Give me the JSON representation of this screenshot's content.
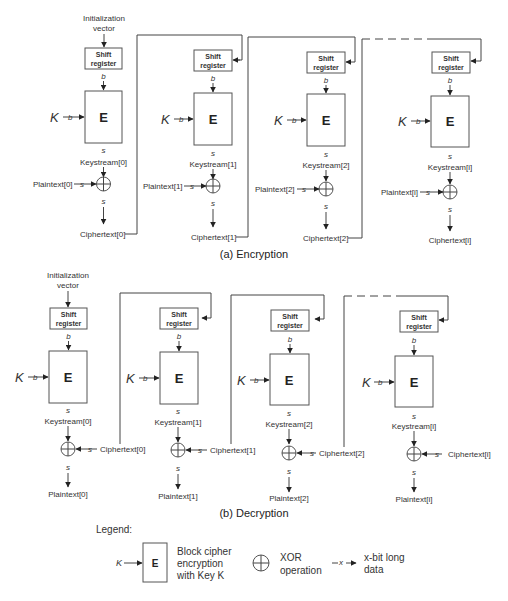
{
  "encryption": {
    "caption": "(a) Encryption",
    "iv_line1": "Initialization",
    "iv_line2": "vector",
    "stages": [
      {
        "shift1": "Shift",
        "shift2": "register",
        "b": "b",
        "E": "E",
        "K": "K",
        "kb": "b",
        "s1": "s",
        "keystream": "Keystream[0]",
        "plaintext": "Plaintext[0]",
        "ps": "s",
        "s2": "s",
        "ciphertext": "Ciphertext[0]"
      },
      {
        "shift1": "Shift",
        "shift2": "register",
        "b": "b",
        "E": "E",
        "K": "K",
        "kb": "b",
        "s1": "s",
        "keystream": "Keystream[1]",
        "plaintext": "Plaintext[1]",
        "ps": "s",
        "s2": "s",
        "ciphertext": "Ciphertext[1]"
      },
      {
        "shift1": "Shift",
        "shift2": "register",
        "b": "b",
        "E": "E",
        "K": "K",
        "kb": "b",
        "s1": "s",
        "keystream": "Keystream[2]",
        "plaintext": "Plaintext[2]",
        "ps": "s",
        "s2": "s",
        "ciphertext": "Ciphertext[2]"
      },
      {
        "shift1": "Shift",
        "shift2": "register",
        "b": "b",
        "E": "E",
        "K": "K",
        "kb": "b",
        "s1": "s",
        "keystream": "Keystream[i]",
        "plaintext": "Plaintext[i]",
        "ps": "s",
        "s2": "s",
        "ciphertext": "Ciphertext[i]"
      }
    ]
  },
  "decryption": {
    "caption": "(b) Decryption",
    "iv_line1": "Initialization",
    "iv_line2": "vector",
    "stages": [
      {
        "shift1": "Shift",
        "shift2": "register",
        "b": "b",
        "E": "E",
        "K": "K",
        "kb": "b",
        "s1": "s",
        "keystream": "Keystream[0]",
        "ciphertext": "Ciphertext[0]",
        "cs": "s",
        "s2": "s",
        "plaintext": "Plaintext[0]"
      },
      {
        "shift1": "Shift",
        "shift2": "register",
        "b": "b",
        "E": "E",
        "K": "K",
        "kb": "b",
        "s1": "s",
        "keystream": "Keystream[1]",
        "ciphertext": "Ciphertext[1]",
        "cs": "s",
        "s2": "s",
        "plaintext": "Plaintext[1]"
      },
      {
        "shift1": "Shift",
        "shift2": "register",
        "b": "b",
        "E": "E",
        "K": "K",
        "kb": "b",
        "s1": "s",
        "keystream": "Keystream[2]",
        "ciphertext": "Ciphertext[2]",
        "cs": "s",
        "s2": "s",
        "plaintext": "Plaintext[2]"
      },
      {
        "shift1": "Shift",
        "shift2": "register",
        "b": "b",
        "E": "E",
        "K": "K",
        "kb": "b",
        "s1": "s",
        "keystream": "Keystream[i]",
        "ciphertext": "Ciphertext[i]",
        "cs": "s",
        "s2": "s",
        "plaintext": "Plaintext[i]"
      }
    ]
  },
  "legend": {
    "title": "Legend:",
    "block_K": "K",
    "block_E": "E",
    "block_desc1": "Block cipher",
    "block_desc2": "encryption",
    "block_desc3": "with Key K",
    "xor_desc1": "XOR",
    "xor_desc2": "operation",
    "data_x": "x",
    "data_desc1": "x-bit long",
    "data_desc2": "data"
  }
}
